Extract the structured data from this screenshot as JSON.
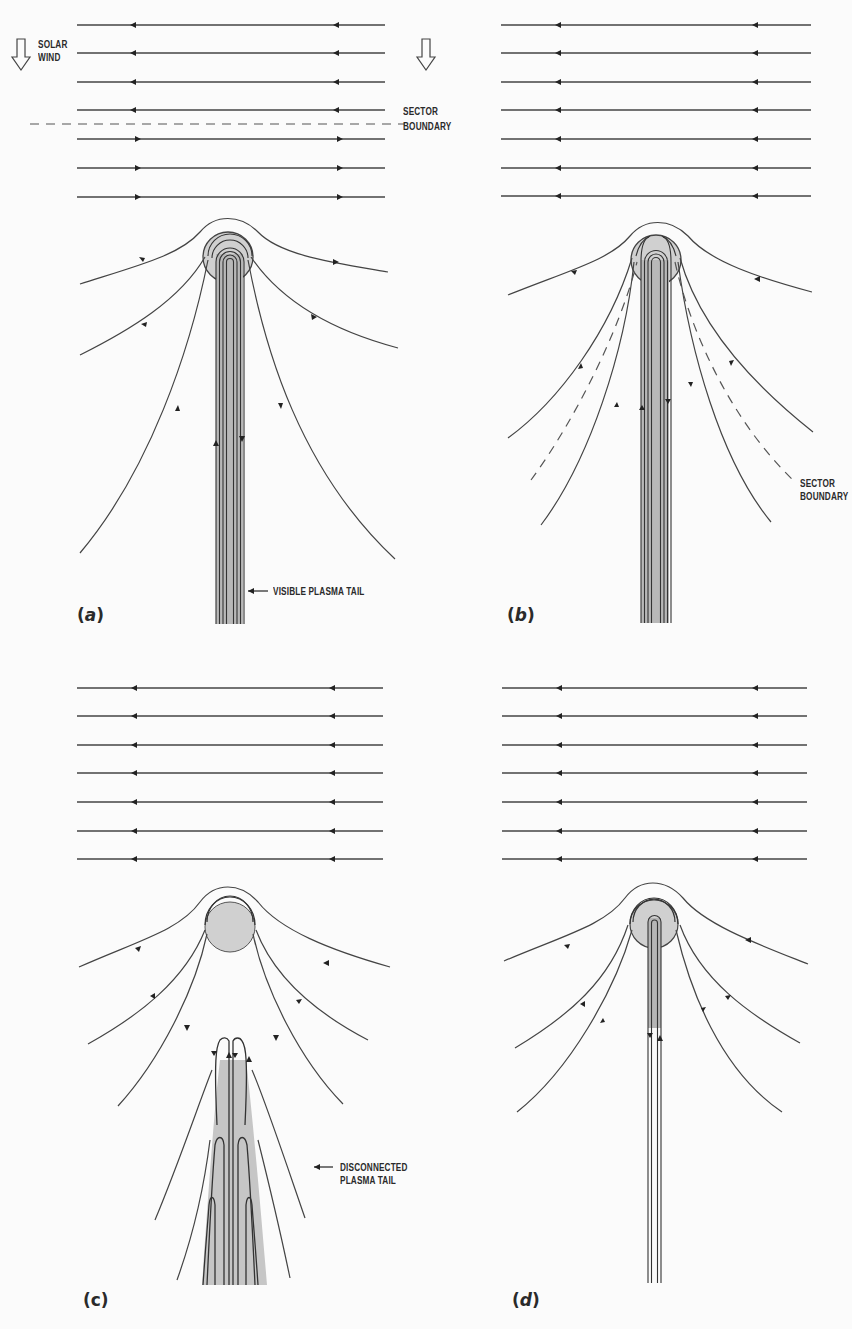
{
  "figure": {
    "colors": {
      "line": "#3a3a3a",
      "tail_fill": "#bdbdbd",
      "coma_fill": "#d2d2d2",
      "background": "#fbfbfb"
    },
    "panels": [
      {
        "id": "a",
        "label_open": "(",
        "label_letter": "a",
        "label_close": ")",
        "annotations": {
          "solar_wind_line1": "SOLAR",
          "solar_wind_line2": "WIND",
          "sector_boundary_line1": "SECTOR",
          "sector_boundary_line2": "BOUNDARY",
          "tail_label": "VISIBLE PLASMA TAIL"
        },
        "field_lines": 7,
        "field_directions": [
          "left",
          "left",
          "left",
          "left",
          "right",
          "right",
          "right"
        ]
      },
      {
        "id": "b",
        "label_open": "(",
        "label_letter": "b",
        "label_close": ")",
        "annotations": {
          "sector_boundary_line1": "SECTOR",
          "sector_boundary_line2": "BOUNDARY"
        },
        "field_lines": 7,
        "field_directions": [
          "left",
          "left",
          "left",
          "left",
          "left",
          "left",
          "left"
        ]
      },
      {
        "id": "c",
        "label_open": "(",
        "label_letter": "c",
        "label_close": ")",
        "annotations": {
          "tail_label_line1": "DISCONNECTED",
          "tail_label_line2": "PLASMA TAIL"
        },
        "field_lines": 7,
        "field_directions": [
          "left",
          "left",
          "left",
          "left",
          "left",
          "left",
          "left"
        ]
      },
      {
        "id": "d",
        "label_open": "(",
        "label_letter": "d",
        "label_close": ")",
        "annotations": {},
        "field_lines": 7,
        "field_directions": [
          "left",
          "left",
          "left",
          "left",
          "left",
          "left",
          "left"
        ]
      }
    ]
  }
}
